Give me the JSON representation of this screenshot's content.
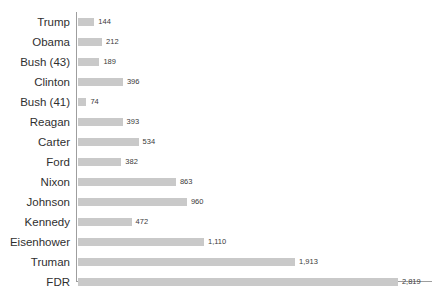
{
  "chart_data": {
    "type": "bar",
    "orientation": "horizontal",
    "title": "",
    "subtitle": "",
    "xlabel": "",
    "ylabel": "",
    "xlim": [
      0,
      3100
    ],
    "grid": false,
    "legend": false,
    "bar_color": "#c9c9c9",
    "axis_color": "#9e9e9e",
    "label_color": "#2f2f2f",
    "value_label_color": "#3a3a3a",
    "background": "#ffffff",
    "categories": [
      "Trump",
      "Obama",
      "Bush (43)",
      "Clinton",
      "Bush (41)",
      "Reagan",
      "Carter",
      "Ford",
      "Nixon",
      "Johnson",
      "Kennedy",
      "Eisenhower",
      "Truman",
      "FDR"
    ],
    "values": [
      144,
      212,
      189,
      396,
      74,
      393,
      534,
      382,
      863,
      960,
      472,
      1110,
      1913,
      2819
    ],
    "value_labels": [
      "144",
      "212",
      "189",
      "396",
      "74",
      "393",
      "534",
      "382",
      "863",
      "960",
      "472",
      "1,110",
      "1,913",
      "2,819"
    ]
  }
}
